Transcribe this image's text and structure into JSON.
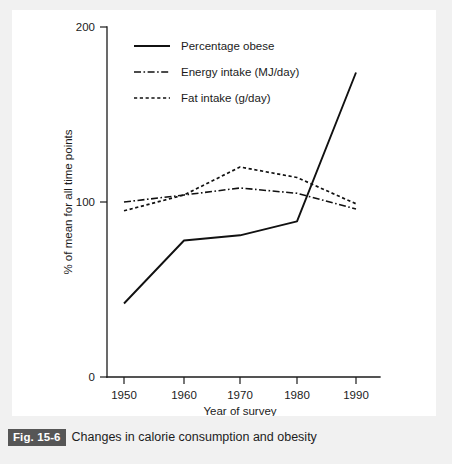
{
  "figure": {
    "number_label": "Fig. 15-6",
    "caption": "Changes in calorie consumption and obesity"
  },
  "chart_data": {
    "type": "line",
    "title": "",
    "subtitle": "",
    "xlabel": "Year of survey",
    "ylabel": "% of mean for all time points",
    "x": [
      1950,
      1960,
      1970,
      1980,
      1990
    ],
    "xtick_labels": [
      "1950",
      "1960",
      "1970",
      "1980",
      "1990"
    ],
    "ytick_labels": [
      "0",
      "100",
      "200"
    ],
    "yticks": [
      0,
      100,
      200
    ],
    "xlim": [
      1946,
      1994
    ],
    "ylim": [
      0,
      200
    ],
    "grid": false,
    "legend_position": "top-left-inside",
    "series": [
      {
        "name": "Percentage obese",
        "style": "solid",
        "values": [
          42,
          78,
          81,
          89,
          174
        ]
      },
      {
        "name": "Energy intake (MJ/day)",
        "style": "dash-dot",
        "values": [
          100,
          104,
          108,
          105,
          96
        ]
      },
      {
        "name": "Fat intake (g/day)",
        "style": "dotted",
        "values": [
          95,
          104,
          120,
          114,
          99
        ]
      }
    ]
  },
  "colors": {
    "ink": "#111111",
    "panel": "#ffffff",
    "page": "#f1f1f1",
    "fig_badge": "#565656",
    "fig_badge_text": "#ffffff"
  }
}
